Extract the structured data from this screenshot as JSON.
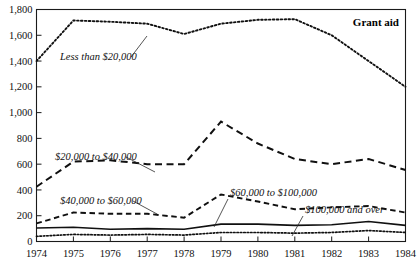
{
  "chart_data": {
    "type": "line",
    "title": "Grant aid",
    "xlabel": "",
    "ylabel": "",
    "grid": false,
    "legend_position": "inline-annotations",
    "x": [
      1974,
      1975,
      1976,
      1977,
      1978,
      1979,
      1980,
      1981,
      1982,
      1983,
      1984
    ],
    "xtick_labels": [
      "1974",
      "1975",
      "1976",
      "1977",
      "1978",
      "1979",
      "1980",
      "1981",
      "1982",
      "1983",
      "1984"
    ],
    "ylim": [
      0,
      1800
    ],
    "ytick_values": [
      0,
      200,
      400,
      600,
      800,
      1000,
      1200,
      1400,
      1600,
      1800
    ],
    "ytick_labels": [
      "0",
      "200",
      "400",
      "600",
      "800",
      "1,000",
      "1,200",
      "1,400",
      "1,600",
      "1,800"
    ],
    "series": [
      {
        "name": "Less than $20,000",
        "style": "fine-dotted",
        "values": [
          1400,
          1715,
          1705,
          1690,
          1610,
          1690,
          1720,
          1725,
          1600,
          1400,
          1200
        ]
      },
      {
        "name": "$20,000 to $40,000",
        "style": "long-dashed",
        "values": [
          425,
          620,
          630,
          600,
          600,
          930,
          760,
          640,
          600,
          640,
          555
        ]
      },
      {
        "name": "$40,000 to $60,000",
        "style": "medium-dashed",
        "values": [
          140,
          225,
          215,
          215,
          185,
          365,
          310,
          250,
          265,
          275,
          225
        ]
      },
      {
        "name": "$60,000 to $100,000",
        "style": "solid",
        "values": [
          105,
          110,
          95,
          100,
          95,
          135,
          135,
          125,
          130,
          155,
          125
        ]
      },
      {
        "name": "$100,000 and over",
        "style": "dotted",
        "values": [
          40,
          55,
          50,
          55,
          50,
          70,
          70,
          65,
          70,
          85,
          70
        ]
      }
    ],
    "annotations": [
      {
        "text": "Less than $20,000",
        "label_x": 60,
        "label_y": 60,
        "leader_from_x": 131,
        "leader_from_y": 57,
        "leader_to_x": 147,
        "leader_to_y": 36
      },
      {
        "text": "$20,000 to $40,000",
        "label_x": 55,
        "label_y": 160,
        "leader_from_x": 126,
        "leader_from_y": 157,
        "leader_to_x": 155,
        "leader_to_y": 172
      },
      {
        "text": "$40,000 to $60,000",
        "label_x": 60,
        "label_y": 204,
        "leader_from_x": 133,
        "leader_from_y": 201,
        "leader_to_x": 157,
        "leader_to_y": 214
      },
      {
        "text": "$60,000 to $100,000",
        "label_x": 230,
        "label_y": 196,
        "leader_from_x": 228,
        "leader_from_y": 199,
        "leader_to_x": 214,
        "leader_to_y": 227
      },
      {
        "text": "$100,000 and over",
        "label_x": 305,
        "label_y": 213,
        "leader_from_x": 303,
        "leader_from_y": 216,
        "leader_to_x": 292,
        "leader_to_y": 236
      }
    ]
  },
  "colors": {
    "ink": "#101010",
    "axis": "#1a1a1a",
    "background": "#ffffff"
  }
}
